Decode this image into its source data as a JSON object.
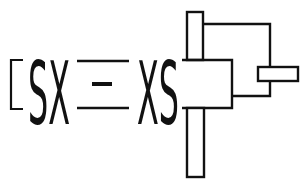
{
  "diagram": {
    "left_term": "SX",
    "right_term": "XS",
    "equals_symbol": "=",
    "colors": {
      "stroke": "#111111",
      "background": "#ffffff"
    }
  }
}
